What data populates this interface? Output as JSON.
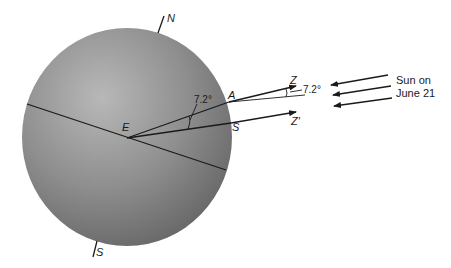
{
  "diagram": {
    "labels": {
      "north_pole": "N",
      "south_pole": "S",
      "center": "E",
      "point_a": "A",
      "point_s": "S",
      "zenith": "Z",
      "zenith_prime": "Z′",
      "angle_inner": "7.2°",
      "angle_outer": "7.2°",
      "sun_line1": "Sun on",
      "sun_line2": "June 21"
    },
    "colors": {
      "sphere_light": "#b4b4b4",
      "sphere_dark": "#6e6e6e",
      "line": "#1a1a1a",
      "background": "#ffffff"
    }
  }
}
